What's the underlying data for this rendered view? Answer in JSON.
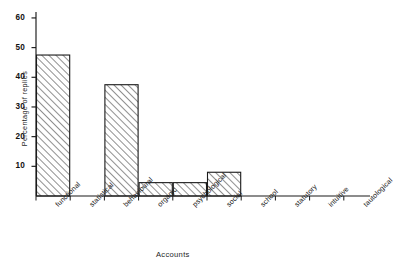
{
  "chart_data": {
    "type": "bar",
    "title": "",
    "subtitle": "",
    "xlabel": "Accounts",
    "ylabel": "Percentage of replies",
    "categories": [
      "functional",
      "statistical",
      "behavioural",
      "organic",
      "psychological",
      "social",
      "school",
      "statutory",
      "intuitive",
      "tautological"
    ],
    "values": [
      47.5,
      0,
      37.5,
      4.5,
      4.5,
      8,
      0,
      0,
      0,
      0
    ],
    "ylim": [
      0,
      62
    ],
    "ytick_labels": [
      "10",
      "20",
      "30",
      "40",
      "50",
      "60"
    ],
    "ytick_values": [
      10,
      20,
      30,
      40,
      50,
      60
    ],
    "grid": false,
    "legend": false,
    "legend_position": "none",
    "bar_style": "diagonal-hatch",
    "annotations": []
  },
  "style": {
    "axis_color": "#1a1a1a",
    "bar_edge_color": "#1a1a1a",
    "bar_hatch_color": "#2a2a2a",
    "background": "#ffffff",
    "text_color": "#1a1a1a"
  }
}
